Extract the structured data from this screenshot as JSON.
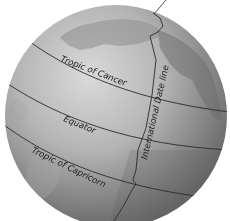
{
  "diagram": {
    "colors": {
      "background": "#ffffff",
      "globe_light": "#d6d6d6",
      "globe_dark": "#6e6e6e",
      "land": "#9a9a9a",
      "lines": "#2a2a2a"
    },
    "labels": {
      "tropic_of_cancer": "Tropic of Cancer",
      "equator": "Equator",
      "tropic_of_capricorn": "Tropic of Capricorn",
      "international_date_line": "International Date line"
    }
  }
}
